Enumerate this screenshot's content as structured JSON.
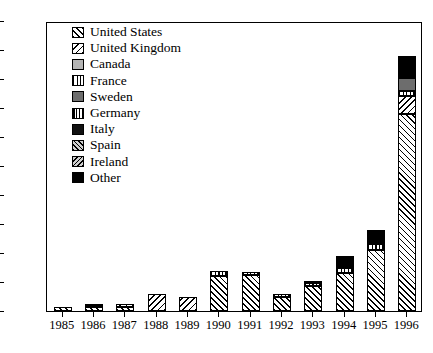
{
  "chart_data": {
    "type": "bar",
    "subtype": "stacked-bar",
    "title": "",
    "xlabel": "",
    "ylabel": "",
    "ylim": [
      0,
      100
    ],
    "ytick_step": 10,
    "grid": false,
    "legend_position": "top-left-inside",
    "categories": [
      "1985",
      "1986",
      "1987",
      "1988",
      "1989",
      "1990",
      "1991",
      "1992",
      "1993",
      "1994",
      "1995",
      "1996"
    ],
    "yticks": [
      "0",
      "10",
      "20",
      "30",
      "40",
      "50",
      "60",
      "70",
      "80",
      "90",
      "100"
    ],
    "series": [
      {
        "name": "United States",
        "pattern": "diagonal-up-hatch",
        "values": [
          1.5,
          1.5,
          1.5,
          0.0,
          0.0,
          12.0,
          12.5,
          5.0,
          8.5,
          13.0,
          21.0,
          68.0
        ]
      },
      {
        "name": "United Kingdom",
        "pattern": "diagonal-down-hatch",
        "values": [
          0.0,
          0.0,
          0.8,
          6.0,
          5.0,
          0.0,
          0.0,
          0.0,
          0.0,
          0.0,
          0.0,
          6.0
        ]
      },
      {
        "name": "Canada",
        "pattern": "light-gray-solid",
        "values": [
          0.0,
          0.0,
          0.0,
          0.0,
          0.0,
          0.0,
          0.0,
          0.0,
          0.0,
          0.0,
          0.0,
          0.0
        ]
      },
      {
        "name": "France",
        "pattern": "vertical-stripes",
        "values": [
          0.0,
          0.0,
          0.0,
          0.0,
          0.0,
          1.8,
          1.0,
          0.8,
          1.0,
          2.0,
          2.0,
          2.0
        ]
      },
      {
        "name": "Sweden",
        "pattern": "dark-gray-solid",
        "values": [
          0.0,
          0.0,
          0.0,
          0.0,
          0.0,
          0.0,
          0.0,
          0.0,
          0.0,
          0.0,
          0.0,
          4.5
        ]
      },
      {
        "name": "Germany",
        "pattern": "dense-vertical-stripes",
        "values": [
          0.0,
          0.0,
          0.0,
          0.0,
          0.0,
          0.0,
          0.0,
          0.0,
          0.0,
          0.0,
          0.0,
          0.0
        ]
      },
      {
        "name": "Italy",
        "pattern": "black-solid",
        "values": [
          0.0,
          0.0,
          0.0,
          0.0,
          0.0,
          0.0,
          0.0,
          0.0,
          0.0,
          0.0,
          0.0,
          0.0
        ]
      },
      {
        "name": "Spain",
        "pattern": "diagonal-up-gray",
        "values": [
          0.0,
          0.0,
          0.0,
          0.0,
          0.0,
          0.0,
          0.0,
          0.0,
          0.0,
          0.0,
          0.0,
          0.0
        ]
      },
      {
        "name": "Ireland",
        "pattern": "diagonal-down-gray",
        "values": [
          0.0,
          0.0,
          0.0,
          0.0,
          0.0,
          0.0,
          0.0,
          0.0,
          0.0,
          0.0,
          0.0,
          0.0
        ]
      },
      {
        "name": "Other",
        "pattern": "black-fill",
        "values": [
          0.0,
          0.8,
          0.0,
          0.0,
          0.0,
          0.0,
          0.0,
          0.0,
          0.5,
          4.0,
          5.0,
          7.5
        ]
      }
    ],
    "totals": [
      1.5,
      2.3,
      2.3,
      6.0,
      5.0,
      13.8,
      13.5,
      5.8,
      10.0,
      19.0,
      28.0,
      88.0
    ]
  },
  "legend": {
    "entries": [
      {
        "label": "United States",
        "swatch": "p-us"
      },
      {
        "label": "United Kingdom",
        "swatch": "p-uk"
      },
      {
        "label": "Canada",
        "swatch": "p-ca"
      },
      {
        "label": "France",
        "swatch": "p-fr"
      },
      {
        "label": "Sweden",
        "swatch": "p-se"
      },
      {
        "label": "Germany",
        "swatch": "p-de"
      },
      {
        "label": "Italy",
        "swatch": "p-it"
      },
      {
        "label": "Spain",
        "swatch": "p-es"
      },
      {
        "label": "Ireland",
        "swatch": "p-ie"
      },
      {
        "label": "Other",
        "swatch": "p-other"
      }
    ]
  },
  "series_swatch_classes": [
    "p-us",
    "p-uk",
    "p-ca",
    "p-fr",
    "p-se",
    "p-de",
    "p-it",
    "p-es",
    "p-ie",
    "p-other"
  ]
}
